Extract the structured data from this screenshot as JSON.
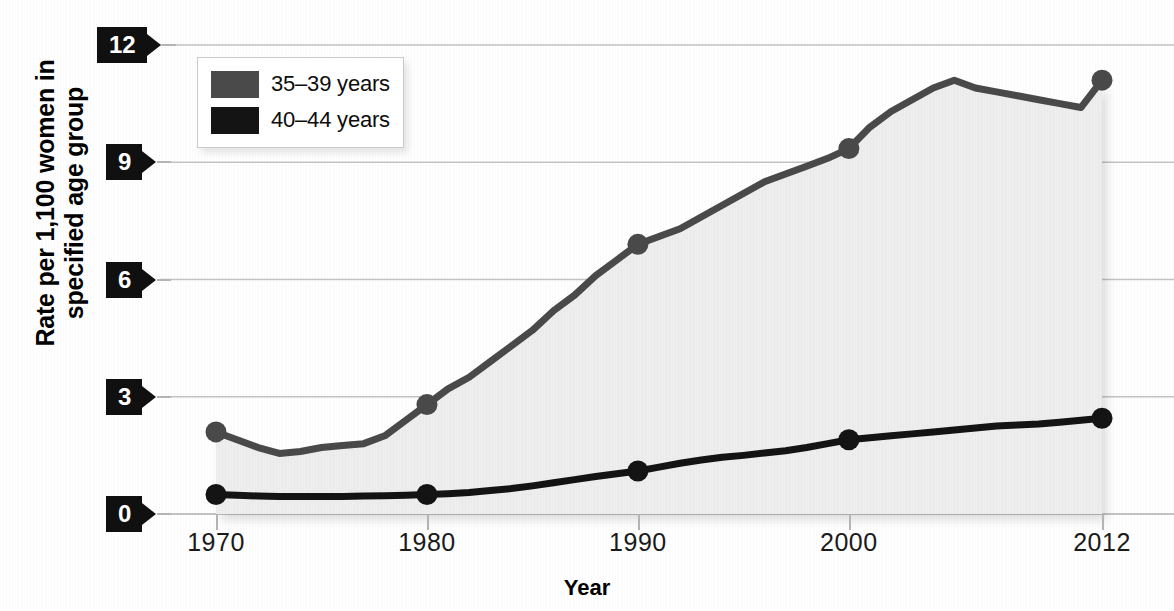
{
  "chart_data": {
    "type": "line",
    "title": "",
    "subtitle": "",
    "xlabel": "Year",
    "ylabel": "Rate per 1,100 women in specified age group",
    "xlim": [
      1968.5,
      2013.5
    ],
    "ylim": [
      0,
      12.6
    ],
    "yticks": [
      0,
      3,
      6,
      9,
      12
    ],
    "ytick_labels": [
      "0",
      "3",
      "6",
      "9",
      "12"
    ],
    "xticks": [
      1970,
      1980,
      1990,
      2000,
      2012
    ],
    "xtick_labels": [
      "1970",
      "1980",
      "1990",
      "2000",
      "2012"
    ],
    "grid": "horizontal",
    "legend_position": "upper-left-inside",
    "series": [
      {
        "name": "35-39 years",
        "label": "35–39 years",
        "color": "#4a4a4a",
        "fill": "#eeeeee",
        "marker_years": [
          1970,
          1980,
          1990,
          2000,
          2012
        ],
        "marker_values": [
          2.1,
          2.8,
          6.9,
          9.35,
          11.1
        ],
        "x": [
          1970,
          1971,
          1972,
          1973,
          1974,
          1975,
          1976,
          1977,
          1978,
          1979,
          1980,
          1981,
          1982,
          1983,
          1984,
          1985,
          1986,
          1987,
          1988,
          1989,
          1990,
          1991,
          1992,
          1993,
          1994,
          1995,
          1996,
          1997,
          1998,
          1999,
          2000,
          2001,
          2002,
          2003,
          2004,
          2005,
          2006,
          2007,
          2008,
          2009,
          2010,
          2011,
          2012
        ],
        "values": [
          2.1,
          1.9,
          1.7,
          1.55,
          1.6,
          1.7,
          1.75,
          1.8,
          2.0,
          2.4,
          2.8,
          3.2,
          3.5,
          3.9,
          4.3,
          4.7,
          5.2,
          5.6,
          6.1,
          6.5,
          6.9,
          7.1,
          7.3,
          7.6,
          7.9,
          8.2,
          8.5,
          8.7,
          8.9,
          9.1,
          9.35,
          9.9,
          10.3,
          10.6,
          10.9,
          11.1,
          10.9,
          10.8,
          10.7,
          10.6,
          10.5,
          10.4,
          11.1
        ]
      },
      {
        "name": "40-44 years",
        "label": "40–44 years",
        "color": "#141414",
        "marker_years": [
          1970,
          1980,
          1990,
          2000,
          2012
        ],
        "marker_values": [
          0.5,
          0.5,
          1.1,
          1.9,
          2.45
        ],
        "x": [
          1970,
          1971,
          1972,
          1973,
          1974,
          1975,
          1976,
          1977,
          1978,
          1979,
          1980,
          1981,
          1982,
          1983,
          1984,
          1985,
          1986,
          1987,
          1988,
          1989,
          1990,
          1991,
          1992,
          1993,
          1994,
          1995,
          1996,
          1997,
          1998,
          1999,
          2000,
          2001,
          2002,
          2003,
          2004,
          2005,
          2006,
          2007,
          2008,
          2009,
          2010,
          2011,
          2012
        ],
        "values": [
          0.5,
          0.48,
          0.46,
          0.45,
          0.45,
          0.45,
          0.45,
          0.46,
          0.47,
          0.48,
          0.5,
          0.52,
          0.55,
          0.6,
          0.65,
          0.72,
          0.8,
          0.88,
          0.96,
          1.03,
          1.1,
          1.2,
          1.3,
          1.38,
          1.45,
          1.5,
          1.56,
          1.62,
          1.7,
          1.8,
          1.9,
          1.95,
          2.0,
          2.05,
          2.1,
          2.15,
          2.2,
          2.25,
          2.28,
          2.3,
          2.35,
          2.4,
          2.45
        ]
      }
    ]
  },
  "axes": {
    "y_title": "Rate per 1,100 women in\nspecified age group",
    "y_title_line1": "Rate per 1,100 women in",
    "y_title_line2": "specified age group",
    "x_title": "Year"
  },
  "legend": {
    "items": [
      {
        "label": "35–39 years",
        "color": "#4a4a4a"
      },
      {
        "label": "40–44 years",
        "color": "#141414"
      }
    ]
  },
  "colors": {
    "series_35_39": "#4a4a4a",
    "series_40_44": "#141414",
    "area_fill": "#eeeeee",
    "gridline": "#c4c4c4",
    "flag_background": "#101010",
    "flag_text": "#ffffff",
    "background": "#ffffff"
  }
}
